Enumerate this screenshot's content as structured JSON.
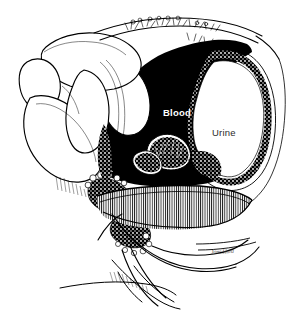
{
  "figure": {
    "type": "medical-line-art-illustration",
    "background_color": "#ffffff",
    "ink_color": "#000000",
    "width": 291,
    "height": 316
  },
  "labels": {
    "blood": {
      "text": "Blood",
      "color": "#ffffff",
      "on_background": "#000000"
    },
    "urine": {
      "text": "Urine",
      "color": "#2b2b2b",
      "on_background": "#ffffff"
    }
  },
  "signature": {
    "text": "Jane Hurd",
    "color": "#3a3a3a"
  },
  "regions": {
    "blood_cavity": {
      "name": "blood-filled cavity",
      "fill": "#000000"
    },
    "bladder_lumen": {
      "name": "urine-filled bladder lumen",
      "fill": "#ffffff"
    },
    "bladder_wall": {
      "name": "stippled bladder wall",
      "fill": "#000000"
    },
    "muscle_hatching": {
      "name": "striated muscle hatching",
      "fill": "#111111"
    }
  }
}
